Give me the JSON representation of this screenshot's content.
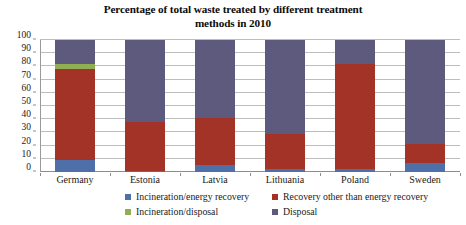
{
  "chart_data": {
    "type": "bar",
    "title": "Percentage of total waste treated by different treatment methods in 2010",
    "title_line1": "Percentage of total waste treated by different treatment",
    "title_line2": "methods in 2010",
    "subtitle": "",
    "xlabel": "",
    "ylabel": "",
    "stacked": true,
    "grid": true,
    "legend_position": "bottom",
    "ylim": [
      0,
      100
    ],
    "ytick_labels": [
      "0",
      "10",
      "20",
      "30",
      "40",
      "50",
      "60",
      "70",
      "80",
      "90",
      "100"
    ],
    "ytick_values": [
      0,
      10,
      20,
      30,
      40,
      50,
      60,
      70,
      80,
      90,
      100
    ],
    "categories": [
      "Germany",
      "Estonia",
      "Latvia",
      "Lithuania",
      "Poland",
      "Sweden"
    ],
    "series": [
      {
        "name": "Incineration/energy recovery",
        "color": "#4F6FA8",
        "values": [
          9,
          1,
          5,
          2,
          2,
          7
        ]
      },
      {
        "name": "Recovery other than energy recovery",
        "color": "#A33227",
        "values": [
          69,
          37,
          36,
          27,
          80,
          14
        ]
      },
      {
        "name": "Incineration/disposal",
        "color": "#8FAF52",
        "values": [
          4,
          0,
          0,
          0,
          0,
          0
        ]
      },
      {
        "name": "Disposal",
        "color": "#5E5A7E",
        "values": [
          18,
          62,
          59,
          71,
          18,
          79
        ]
      }
    ]
  },
  "legend": {
    "items": [
      {
        "label": "Incineration/energy recovery",
        "color": "#4F6FA8"
      },
      {
        "label": "Recovery other than energy recovery",
        "color": "#A33227"
      },
      {
        "label": "Incineration/disposal",
        "color": "#8FAF52"
      },
      {
        "label": "Disposal",
        "color": "#5E5A7E"
      }
    ]
  },
  "colors": {
    "incineration_energy_recovery": "#4F6FA8",
    "recovery_other": "#A33227",
    "incineration_disposal": "#8FAF52",
    "disposal": "#5E5A7E",
    "gridline": "#bdbdbd",
    "axis": "#8d8d8d",
    "background": "#ffffff",
    "text": "#1a1a1a"
  }
}
